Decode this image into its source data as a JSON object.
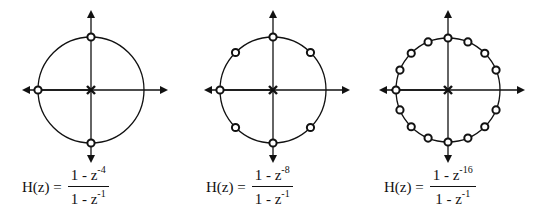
{
  "diagrams": [
    {
      "id": "n4",
      "N": 4,
      "formula": {
        "lhs": "H(z) =",
        "num_base": "1 - z",
        "num_exp": "-4",
        "den_base": "1 - z",
        "den_exp": "-1"
      },
      "zeros_count": 3,
      "poles": [
        "origin"
      ]
    },
    {
      "id": "n8",
      "N": 8,
      "formula": {
        "lhs": "H(z) =",
        "num_base": "1 - z",
        "num_exp": "-8",
        "den_base": "1 - z",
        "den_exp": "-1"
      },
      "zeros_count": 7,
      "poles": [
        "origin"
      ]
    },
    {
      "id": "n16",
      "N": 16,
      "formula": {
        "lhs": "H(z) =",
        "num_base": "1 - z",
        "num_exp": "-16",
        "den_base": "1 - z",
        "den_exp": "-1"
      },
      "zeros_count": 15,
      "poles": [
        "origin"
      ]
    }
  ],
  "colors": {
    "ink": "#111111",
    "background": "#ffffff"
  }
}
